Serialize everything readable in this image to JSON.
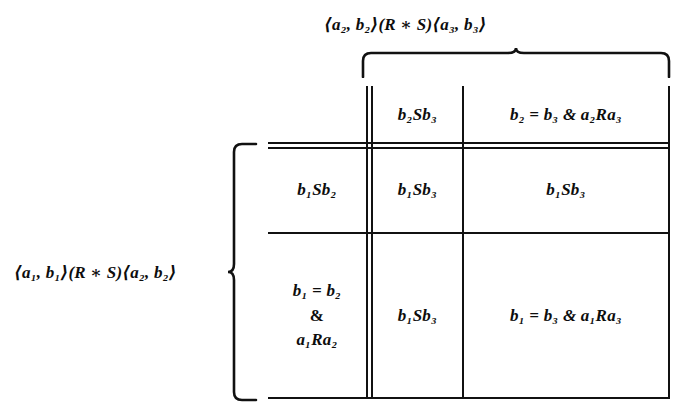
{
  "figure": {
    "type": "math-truth-table",
    "top_label": "⟨a₂, b₂⟩(R ∗ S)⟨a₃, b₃⟩",
    "left_label": "⟨a₁, b₁⟩(R ∗ S)⟨a₂, b₂⟩",
    "ink_color": "#111111",
    "background_color": "#ffffff"
  },
  "table": {
    "column_headers": [
      "b₂Sb₃",
      "b₂ = b₃ & a₂Ra₃"
    ],
    "rows": [
      {
        "header_lines": [
          "b₁Sb₂"
        ],
        "cells": [
          "b₁Sb₃",
          "b₁Sb₃"
        ]
      },
      {
        "header_lines": [
          "b₁ = b₂",
          "&",
          "a₁Ra₂"
        ],
        "cells": [
          "b₁Sb₃",
          "b₁ = b₃ & a₁Ra₃"
        ]
      }
    ]
  }
}
